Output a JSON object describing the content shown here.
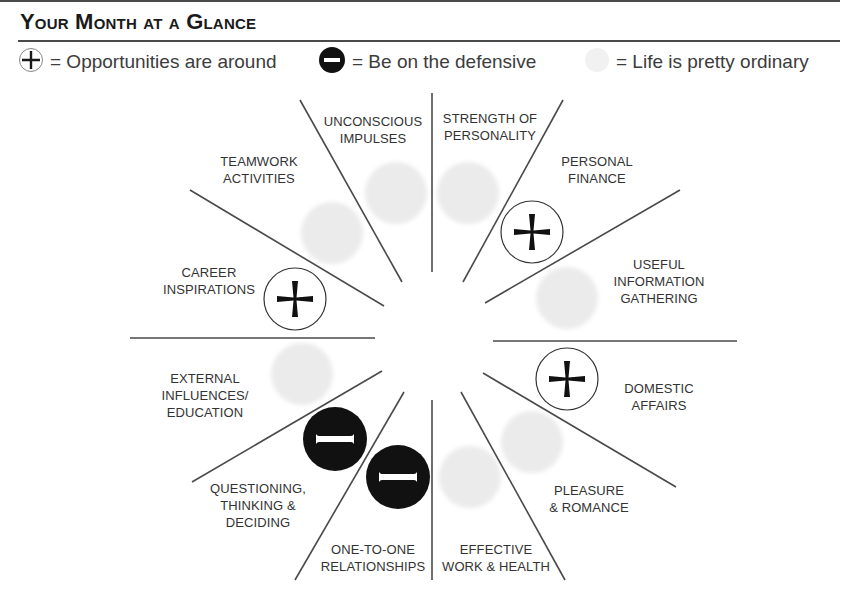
{
  "header": {
    "title": "Your Month at a Glance"
  },
  "legend": [
    {
      "symbol": "plus-circle",
      "label": "= Opportunities are around"
    },
    {
      "symbol": "minus-circle",
      "label": "= Be on the defensive"
    },
    {
      "symbol": "faint-circle",
      "label": "= Life is pretty ordinary"
    }
  ],
  "colors": {
    "ink": "#1a1a1a",
    "line": "#4a4a4a",
    "text": "#333333",
    "ordinary_blob": "#ececec"
  },
  "wheel": {
    "sectors": [
      {
        "id": "strength-of-personality",
        "line1": "STRENGTH OF",
        "line2": "PERSONALITY",
        "line3": "",
        "status": "ordinary"
      },
      {
        "id": "personal-finance",
        "line1": "PERSONAL",
        "line2": "FINANCE",
        "line3": "",
        "status": "opportunity"
      },
      {
        "id": "useful-information-gathering",
        "line1": "USEFUL",
        "line2": "INFORMATION",
        "line3": "GATHERING",
        "status": "ordinary"
      },
      {
        "id": "domestic-affairs",
        "line1": "DOMESTIC",
        "line2": "AFFAIRS",
        "line3": "",
        "status": "opportunity"
      },
      {
        "id": "pleasure-romance",
        "line1": "PLEASURE",
        "line2": "& ROMANCE",
        "line3": "",
        "status": "ordinary"
      },
      {
        "id": "effective-work-health",
        "line1": "EFFECTIVE",
        "line2": "WORK & HEALTH",
        "line3": "",
        "status": "ordinary"
      },
      {
        "id": "one-to-one-relationships",
        "line1": "ONE-TO-ONE",
        "line2": "RELATIONSHIPS",
        "line3": "",
        "status": "defensive"
      },
      {
        "id": "questioning-thinking-deciding",
        "line1": "QUESTIONING,",
        "line2": "THINKING &",
        "line3": "DECIDING",
        "status": "defensive"
      },
      {
        "id": "external-influences-education",
        "line1": "EXTERNAL",
        "line2": "INFLUENCES/",
        "line3": "EDUCATION",
        "status": "ordinary"
      },
      {
        "id": "career-inspirations",
        "line1": "CAREER",
        "line2": "INSPIRATIONS",
        "line3": "",
        "status": "opportunity"
      },
      {
        "id": "teamwork-activities",
        "line1": "TEAMWORK",
        "line2": "ACTIVITIES",
        "line3": "",
        "status": "ordinary"
      },
      {
        "id": "unconscious-impulses",
        "line1": "UNCONSCIOUS",
        "line2": "IMPULSES",
        "line3": "",
        "status": "ordinary"
      }
    ]
  }
}
